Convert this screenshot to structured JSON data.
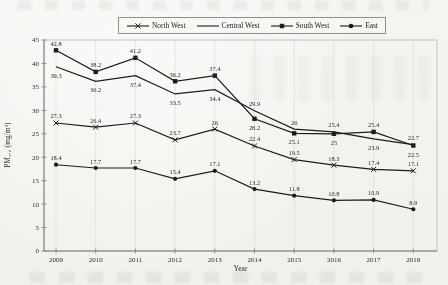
{
  "chart_data": {
    "type": "line",
    "title": "",
    "xlabel": "Year",
    "ylabel": "PM₂.₅ (mg/m³)",
    "x": [
      2009,
      2010,
      2011,
      2012,
      2013,
      2014,
      2015,
      2016,
      2017,
      2018
    ],
    "ylim": [
      0,
      45
    ],
    "yticks": [
      0,
      5,
      10,
      15,
      20,
      25,
      30,
      35,
      40,
      45
    ],
    "grid": "vertical",
    "legend_position": "top-center",
    "line_color": "#1c1c1c",
    "gridline_color": "#dcdbd7",
    "axis_color": "#7d7d79",
    "box_color": "#b8b7b3",
    "series": [
      {
        "name": "North West",
        "marker": "x",
        "values": [
          27.3,
          26.4,
          27.3,
          23.7,
          26,
          22.4,
          19.5,
          18.3,
          17.4,
          17.1
        ],
        "labels_below": []
      },
      {
        "name": "Central West",
        "marker": "none",
        "values": [
          39.3,
          36.2,
          37.4,
          33.5,
          34.4,
          29.9,
          26,
          25.4,
          23.9,
          22.7
        ],
        "labels_below": [
          0,
          1,
          2,
          3,
          4,
          8
        ]
      },
      {
        "name": "South West",
        "marker": "square",
        "values": [
          42.8,
          38.2,
          41.2,
          36.2,
          37.4,
          28.2,
          25.1,
          25,
          25.4,
          22.5
        ],
        "labels_below": [
          5,
          6,
          7,
          9
        ]
      },
      {
        "name": "East",
        "marker": "circle",
        "values": [
          18.4,
          17.7,
          17.7,
          15.4,
          17.1,
          13.2,
          11.8,
          10.8,
          10.9,
          8.9
        ],
        "labels_below": []
      }
    ]
  }
}
